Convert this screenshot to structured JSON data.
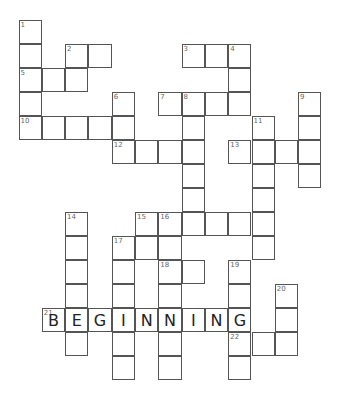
{
  "puzzle": {
    "type": "crossword",
    "origin": {
      "x": 19,
      "y": 20
    },
    "cell_size": {
      "w": 23.3,
      "h": 24
    },
    "cells": [
      {
        "c": 0,
        "r": 0,
        "num": "1"
      },
      {
        "c": 0,
        "r": 1
      },
      {
        "c": 2,
        "r": 1,
        "num": "2"
      },
      {
        "c": 3,
        "r": 1
      },
      {
        "c": 7,
        "r": 1,
        "num": "3"
      },
      {
        "c": 8,
        "r": 1
      },
      {
        "c": 9,
        "r": 1,
        "num": "4"
      },
      {
        "c": 0,
        "r": 2,
        "num": "5"
      },
      {
        "c": 1,
        "r": 2
      },
      {
        "c": 2,
        "r": 2
      },
      {
        "c": 9,
        "r": 2
      },
      {
        "c": 0,
        "r": 3
      },
      {
        "c": 4,
        "r": 3,
        "num": "6"
      },
      {
        "c": 6,
        "r": 3,
        "num": "7"
      },
      {
        "c": 7,
        "r": 3,
        "num": "8"
      },
      {
        "c": 8,
        "r": 3
      },
      {
        "c": 9,
        "r": 3
      },
      {
        "c": 12,
        "r": 3,
        "num": "9"
      },
      {
        "c": 0,
        "r": 4,
        "num": "10"
      },
      {
        "c": 1,
        "r": 4
      },
      {
        "c": 2,
        "r": 4
      },
      {
        "c": 3,
        "r": 4
      },
      {
        "c": 4,
        "r": 4
      },
      {
        "c": 7,
        "r": 4
      },
      {
        "c": 10,
        "r": 4,
        "num": "11"
      },
      {
        "c": 12,
        "r": 4
      },
      {
        "c": 4,
        "r": 5,
        "num": "12"
      },
      {
        "c": 5,
        "r": 5
      },
      {
        "c": 6,
        "r": 5
      },
      {
        "c": 7,
        "r": 5
      },
      {
        "c": 9,
        "r": 5,
        "num": "13"
      },
      {
        "c": 10,
        "r": 5
      },
      {
        "c": 11,
        "r": 5
      },
      {
        "c": 12,
        "r": 5
      },
      {
        "c": 7,
        "r": 6
      },
      {
        "c": 10,
        "r": 6
      },
      {
        "c": 12,
        "r": 6
      },
      {
        "c": 7,
        "r": 7
      },
      {
        "c": 10,
        "r": 7
      },
      {
        "c": 2,
        "r": 8,
        "num": "14"
      },
      {
        "c": 5,
        "r": 8,
        "num": "15"
      },
      {
        "c": 6,
        "r": 8,
        "num": "16"
      },
      {
        "c": 7,
        "r": 8
      },
      {
        "c": 8,
        "r": 8
      },
      {
        "c": 9,
        "r": 8
      },
      {
        "c": 10,
        "r": 8
      },
      {
        "c": 2,
        "r": 9
      },
      {
        "c": 4,
        "r": 9,
        "num": "17"
      },
      {
        "c": 5,
        "r": 9
      },
      {
        "c": 6,
        "r": 9
      },
      {
        "c": 10,
        "r": 9
      },
      {
        "c": 2,
        "r": 10
      },
      {
        "c": 4,
        "r": 10
      },
      {
        "c": 6,
        "r": 10,
        "num": "18"
      },
      {
        "c": 7,
        "r": 10
      },
      {
        "c": 9,
        "r": 10,
        "num": "19"
      },
      {
        "c": 2,
        "r": 11
      },
      {
        "c": 4,
        "r": 11
      },
      {
        "c": 6,
        "r": 11
      },
      {
        "c": 9,
        "r": 11
      },
      {
        "c": 11,
        "r": 11,
        "num": "20"
      },
      {
        "c": 1,
        "r": 12,
        "num": "21",
        "letter": "B"
      },
      {
        "c": 2,
        "r": 12,
        "letter": "E"
      },
      {
        "c": 3,
        "r": 12,
        "letter": "G"
      },
      {
        "c": 4,
        "r": 12,
        "letter": "I"
      },
      {
        "c": 5,
        "r": 12,
        "letter": "N"
      },
      {
        "c": 6,
        "r": 12,
        "letter": "N"
      },
      {
        "c": 7,
        "r": 12,
        "letter": "I"
      },
      {
        "c": 8,
        "r": 12,
        "letter": "N"
      },
      {
        "c": 9,
        "r": 12,
        "letter": "G"
      },
      {
        "c": 11,
        "r": 12
      },
      {
        "c": 2,
        "r": 13
      },
      {
        "c": 4,
        "r": 13
      },
      {
        "c": 6,
        "r": 13
      },
      {
        "c": 9,
        "r": 13,
        "num": "22"
      },
      {
        "c": 10,
        "r": 13
      },
      {
        "c": 11,
        "r": 13
      },
      {
        "c": 4,
        "r": 14
      },
      {
        "c": 6,
        "r": 14
      },
      {
        "c": 9,
        "r": 14
      }
    ],
    "filled_answers": [
      {
        "clue": "21",
        "direction": "across",
        "answer": "BEGINNING"
      }
    ]
  }
}
